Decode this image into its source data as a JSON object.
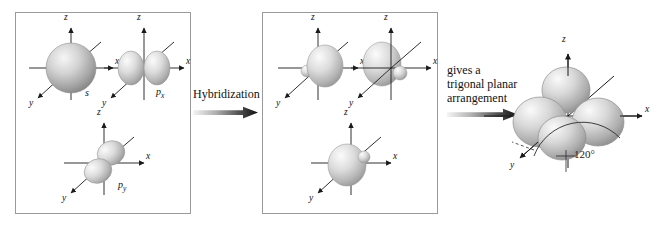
{
  "figure": {
    "title_alt": "sp2 hybridization of atomic orbitals giving a trigonal planar arrangement",
    "background": "#ffffff",
    "panel_border_color": "#9a9a9a",
    "orbital_fill_light": "#f2f2f2",
    "orbital_fill_mid": "#c9c9c9",
    "orbital_fill_dark": "#8e8e8e",
    "axis_color": "#1a1a1a"
  },
  "panels": {
    "atomic": {
      "name": "atomic-orbitals-panel",
      "orbitals": [
        {
          "id": "s",
          "label": "s",
          "sub": "",
          "axis_x": "x",
          "axis_y": "y",
          "axis_z": "z"
        },
        {
          "id": "px",
          "label": "p",
          "sub": "x",
          "axis_x": "x",
          "axis_y": "y",
          "axis_z": "z"
        },
        {
          "id": "py",
          "label": "p",
          "sub": "y",
          "axis_x": "x",
          "axis_y": "y",
          "axis_z": "z"
        }
      ]
    },
    "hybrid": {
      "name": "hybrid-orbitals-panel",
      "orbitals": [
        {
          "id": "sp2-a",
          "label": "",
          "sub": "",
          "axis_x": "x",
          "axis_y": "y",
          "axis_z": "z"
        },
        {
          "id": "sp2-b",
          "label": "",
          "sub": "",
          "axis_x": "x",
          "axis_y": "y",
          "axis_z": "z"
        },
        {
          "id": "sp2-c",
          "label": "",
          "sub": "",
          "axis_x": "x",
          "axis_y": "y",
          "axis_z": "z"
        }
      ]
    }
  },
  "steps": {
    "hybridization_label": "Hybridization",
    "result_line1": "gives a",
    "result_line2": "trigonal planar",
    "result_line3": "arrangement"
  },
  "result": {
    "name": "trigonal-planar-structure",
    "angle_label": "120°",
    "axis_x": "x",
    "axis_y": "y",
    "axis_z": "z"
  }
}
